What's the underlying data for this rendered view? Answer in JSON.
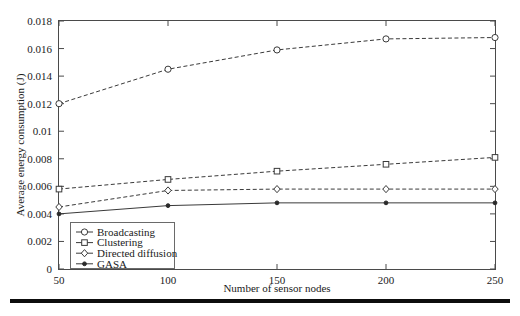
{
  "chart_data": {
    "type": "line",
    "title": "",
    "xlabel": "Number of sensor nodes",
    "ylabel": "Average energy consumption (J)",
    "x": [
      50,
      100,
      150,
      200,
      250
    ],
    "xticklabels": [
      "50",
      "100",
      "150",
      "200",
      "250"
    ],
    "yticklabels": [
      "0",
      "0.002",
      "0.004",
      "0.006",
      "0.008",
      "0.01",
      "0.012",
      "0.014",
      "0.016",
      "0.018"
    ],
    "ytickvalues": [
      0,
      0.002,
      0.004,
      0.006,
      0.008,
      0.01,
      0.012,
      0.014,
      0.016,
      0.018
    ],
    "xlim": [
      50,
      250
    ],
    "ylim": [
      0,
      0.018
    ],
    "grid": false,
    "legend_position": "lower left",
    "series": [
      {
        "name": "Broadcasting",
        "marker": "circle",
        "linestyle": "dashed",
        "values": [
          0.012,
          0.0145,
          0.0159,
          0.0167,
          0.0168
        ]
      },
      {
        "name": "Clustering",
        "marker": "square",
        "linestyle": "dashed",
        "values": [
          0.0058,
          0.0065,
          0.0071,
          0.0076,
          0.0081
        ]
      },
      {
        "name": "Directed diffusion",
        "marker": "diamond",
        "linestyle": "dashed",
        "values": [
          0.0045,
          0.0057,
          0.0058,
          0.0058,
          0.0058
        ]
      },
      {
        "name": "GASA",
        "marker": "dot",
        "linestyle": "solid",
        "values": [
          0.004,
          0.0046,
          0.0048,
          0.0048,
          0.0048
        ]
      }
    ]
  },
  "axes": {
    "xlabel": "Number of sensor nodes",
    "ylabel": "Average energy consumption (J)"
  },
  "legend": {
    "entries": [
      {
        "label": "Broadcasting"
      },
      {
        "label": "Clustering"
      },
      {
        "label": "Directed diffusion"
      },
      {
        "label": "GASA"
      }
    ]
  }
}
